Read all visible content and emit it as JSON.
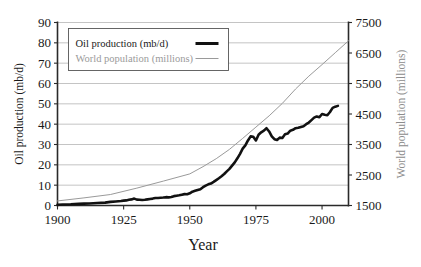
{
  "chart_data": {
    "type": "line",
    "title": "",
    "xlabel": "Year",
    "grid": true,
    "legend_position": "top-left",
    "x_ticks": [
      1900,
      1925,
      1950,
      1975,
      2000
    ],
    "xlim": [
      1900,
      2010
    ],
    "axes": [
      {
        "id": "left",
        "label": "Oil production (mb/d)",
        "ticks": [
          0,
          10,
          20,
          30,
          40,
          50,
          60,
          70,
          80,
          90
        ],
        "lim": [
          0,
          90
        ],
        "color": "#1a1a1a"
      },
      {
        "id": "right",
        "label": "World population (millions)",
        "ticks": [
          1500,
          2500,
          3500,
          4500,
          5500,
          6500,
          7500
        ],
        "lim": [
          1500,
          7500
        ],
        "color": "#8c8c8c"
      }
    ],
    "series": [
      {
        "name": "Oil production (mb/d)",
        "axis": "left",
        "color": "#111111",
        "width": 2.6,
        "x": [
          1900,
          1902,
          1905,
          1908,
          1910,
          1912,
          1915,
          1918,
          1920,
          1922,
          1924,
          1925,
          1926,
          1927,
          1928,
          1929,
          1930,
          1931,
          1932,
          1933,
          1934,
          1935,
          1936,
          1937,
          1938,
          1939,
          1940,
          1941,
          1942,
          1943,
          1944,
          1945,
          1946,
          1947,
          1948,
          1949,
          1950,
          1951,
          1952,
          1953,
          1954,
          1955,
          1956,
          1957,
          1958,
          1959,
          1960,
          1961,
          1962,
          1963,
          1964,
          1965,
          1966,
          1967,
          1968,
          1969,
          1970,
          1971,
          1972,
          1973,
          1974,
          1975,
          1976,
          1977,
          1978,
          1979,
          1980,
          1981,
          1982,
          1983,
          1984,
          1985,
          1986,
          1987,
          1988,
          1989,
          1990,
          1991,
          1992,
          1993,
          1994,
          1995,
          1996,
          1997,
          1998,
          1999,
          2000,
          2001,
          2002,
          2003,
          2004,
          2005,
          2006
        ],
        "y": [
          0.4,
          0.5,
          0.6,
          0.8,
          0.9,
          1.0,
          1.2,
          1.4,
          1.8,
          2.0,
          2.2,
          2.4,
          2.5,
          2.8,
          3.0,
          3.4,
          2.9,
          2.8,
          2.7,
          2.8,
          3.0,
          3.2,
          3.4,
          3.7,
          3.7,
          3.8,
          3.9,
          4.1,
          4.0,
          4.2,
          4.6,
          4.8,
          5.0,
          5.3,
          5.6,
          5.5,
          6.0,
          6.8,
          7.2,
          7.6,
          8.0,
          9.0,
          9.8,
          10.4,
          10.8,
          11.6,
          12.5,
          13.4,
          14.4,
          15.5,
          16.8,
          18.0,
          19.6,
          21.2,
          23.2,
          25.4,
          28.0,
          29.6,
          32.0,
          34.0,
          33.8,
          32.0,
          34.8,
          36.0,
          36.8,
          38.0,
          36.4,
          34.0,
          32.6,
          32.2,
          33.4,
          33.2,
          35.0,
          35.4,
          36.8,
          37.2,
          38.0,
          38.2,
          38.6,
          39.0,
          40.0,
          40.8,
          42.0,
          43.2,
          43.8,
          43.4,
          45.0,
          44.6,
          44.4,
          46.0,
          48.0,
          48.6,
          49.0
        ]
      },
      {
        "name": "World population (millions)",
        "axis": "right",
        "color": "#9a9a9a",
        "width": 1.0,
        "x": [
          1900,
          1910,
          1920,
          1930,
          1940,
          1950,
          1955,
          1960,
          1965,
          1970,
          1975,
          1980,
          1985,
          1990,
          1995,
          2000,
          2005,
          2010
        ],
        "y": [
          1650,
          1750,
          1860,
          2070,
          2300,
          2536,
          2773,
          3035,
          3340,
          3700,
          4070,
          4440,
          4850,
          5320,
          5740,
          6120,
          6510,
          6900
        ]
      }
    ],
    "annotations": []
  },
  "legend": {
    "entries": [
      {
        "label": "Oil production (mb/d)",
        "style": "thick-black"
      },
      {
        "label": "World population (millions)",
        "style": "thin-gray"
      }
    ]
  },
  "colors": {
    "oil_line": "#111111",
    "population_line": "#9a9a9a",
    "gridline": "#b5b5b5",
    "axis": "#2a2a2a",
    "right_axis_title": "#8c8c8c",
    "background": "#ffffff"
  }
}
